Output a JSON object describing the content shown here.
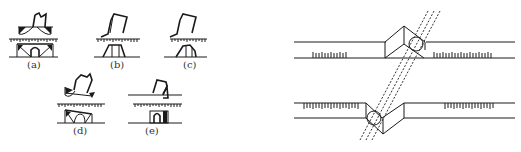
{
  "figure": {
    "left_panel": {
      "description": "Five sketches of a chisel/bit cutting a rail/ruler profile",
      "subfigures": [
        {
          "id": "a",
          "label": "(a)"
        },
        {
          "id": "b",
          "label": "(b)"
        },
        {
          "id": "c",
          "label": "(c)"
        },
        {
          "id": "d",
          "label": "(d)"
        },
        {
          "id": "e",
          "label": "(e)"
        }
      ]
    },
    "right_panel": {
      "description": "Two scaled strips with a prism/wedge and circular tool, crossed by a dashed diagonal band",
      "strips": [
        {
          "name": "upper-strip",
          "ticks": "upward"
        },
        {
          "name": "lower-strip",
          "ticks": "downward"
        }
      ]
    },
    "colors": {
      "ink": "#1a1a1a",
      "background": "#ffffff"
    }
  }
}
